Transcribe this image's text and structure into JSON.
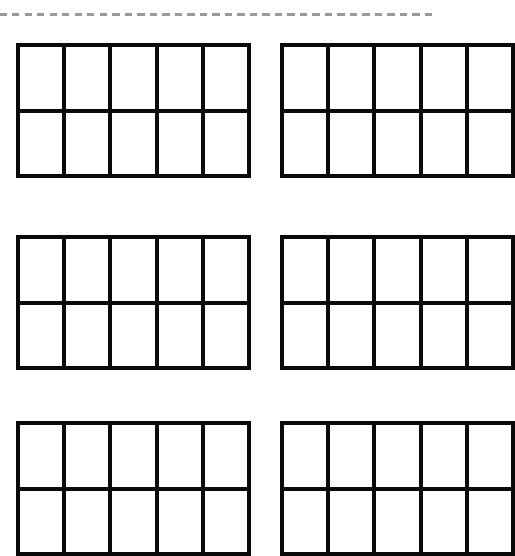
{
  "worksheet": {
    "type": "ten-frames",
    "cut_line": {
      "style": "dashed",
      "color": "#9a9a9a"
    },
    "frame_color": "#0a0a0a",
    "columns_per_frame": 5,
    "rows_per_frame": 2,
    "frames": [
      {
        "id": "frame-r1-c1",
        "row": 1,
        "col": 1,
        "cells": 10,
        "filled": 0
      },
      {
        "id": "frame-r1-c2",
        "row": 1,
        "col": 2,
        "cells": 10,
        "filled": 0
      },
      {
        "id": "frame-r2-c1",
        "row": 2,
        "col": 1,
        "cells": 10,
        "filled": 0
      },
      {
        "id": "frame-r2-c2",
        "row": 2,
        "col": 2,
        "cells": 10,
        "filled": 0
      },
      {
        "id": "frame-r3-c1",
        "row": 3,
        "col": 1,
        "cells": 10,
        "filled": 0
      },
      {
        "id": "frame-r3-c2",
        "row": 3,
        "col": 2,
        "cells": 10,
        "filled": 0
      }
    ]
  }
}
